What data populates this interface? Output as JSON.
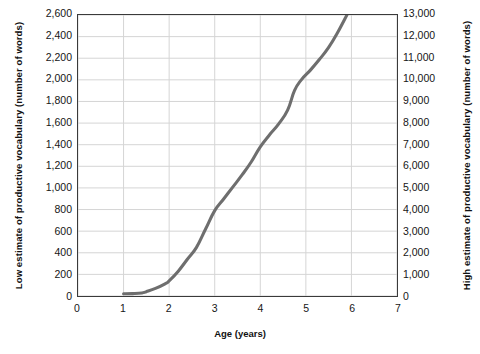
{
  "chart_data": {
    "type": "line",
    "title": "",
    "xlabel": "Age (years)",
    "ylabel": "Low estimate of productive vocabulary (number of words)",
    "y2label": "High estimate of productive vocabulary (number of words)",
    "xlim": [
      0,
      7
    ],
    "ylim": [
      0,
      2600
    ],
    "y2lim": [
      0,
      13000
    ],
    "grid": true,
    "legend": "none",
    "xticks": [
      "0",
      "1",
      "2",
      "3",
      "4",
      "5",
      "6",
      "7"
    ],
    "xtick_values": [
      0,
      1,
      2,
      3,
      4,
      5,
      6,
      7
    ],
    "yticks_left": [
      "0",
      "200",
      "400",
      "600",
      "800",
      "1,000",
      "1,200",
      "1,400",
      "1,600",
      "1,800",
      "2,000",
      "2,200",
      "2,400",
      "2,600"
    ],
    "ytick_left_values": [
      0,
      200,
      400,
      600,
      800,
      1000,
      1200,
      1400,
      1600,
      1800,
      2000,
      2200,
      2400,
      2600
    ],
    "yticks_right": [
      "0",
      "1,000",
      "2,000",
      "3,000",
      "4,000",
      "5,000",
      "6,000",
      "7,000",
      "8,000",
      "9,000",
      "10,000",
      "11,000",
      "12,000",
      "13,000"
    ],
    "ytick_right_values": [
      0,
      1000,
      2000,
      3000,
      4000,
      5000,
      6000,
      7000,
      8000,
      9000,
      10000,
      11000,
      12000,
      13000
    ],
    "line_color": "#6e6e6e",
    "grid_color": "#d5d5d5",
    "frame_color": "#3a3a3a",
    "series": [
      {
        "name": "Productive vocabulary growth",
        "x": [
          1.0,
          1.2,
          1.4,
          1.5,
          1.7,
          1.9,
          2.0,
          2.2,
          2.4,
          2.6,
          2.8,
          3.0,
          3.2,
          3.4,
          3.6,
          3.8,
          4.0,
          4.2,
          4.4,
          4.6,
          4.75,
          4.9,
          5.1,
          5.3,
          5.5,
          5.7,
          5.9
        ],
        "values": [
          20,
          22,
          28,
          40,
          70,
          110,
          140,
          230,
          340,
          450,
          620,
          790,
          900,
          1010,
          1120,
          1240,
          1380,
          1490,
          1590,
          1720,
          1900,
          2000,
          2090,
          2190,
          2300,
          2440,
          2600
        ]
      }
    ]
  }
}
